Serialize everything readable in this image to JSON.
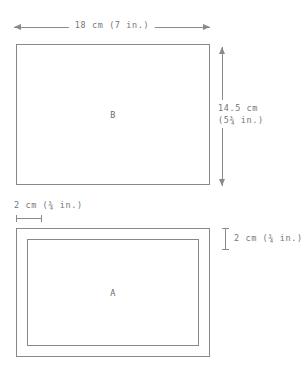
{
  "diagram": {
    "line_color": "#888888",
    "text_color": "#777777",
    "background": "#ffffff",
    "shapes": {
      "upper": {
        "face_label": "B",
        "width_label": "18 cm (7 in.)",
        "height_label_line1": "14.5 cm",
        "height_label_line2": "(5¾ in.)"
      },
      "lower": {
        "face_label": "A",
        "border_label_left": "2 cm (¾ in.)",
        "border_label_right": "2 cm (¾ in.)"
      }
    }
  }
}
